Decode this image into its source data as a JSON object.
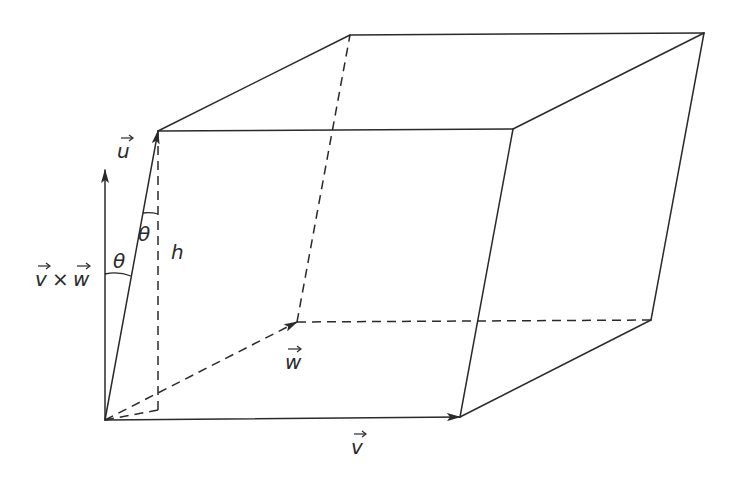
{
  "diagram": {
    "colors": {
      "stroke": "#2a2a2a",
      "background": "#ffffff"
    },
    "labels": {
      "u": "u",
      "v": "v",
      "w": "w",
      "cross": "v × w",
      "cross_v": "v",
      "cross_times": "×",
      "cross_w": "w",
      "theta_top": "θ",
      "theta_bottom": "θ",
      "h": "h"
    },
    "vertices": {
      "origin": [
        105,
        420
      ],
      "v_end": [
        460,
        417
      ],
      "w_end": [
        297,
        322
      ],
      "u_end": [
        158,
        131
      ],
      "front_top_right": [
        513,
        129
      ],
      "back_top_left": [
        350,
        35
      ],
      "back_top_right": [
        704,
        33
      ],
      "back_bottom_right": [
        651,
        320
      ]
    },
    "normal_vector": {
      "from": [
        105,
        420
      ],
      "to": [
        105,
        170
      ]
    },
    "height_line": {
      "from": [
        158,
        131
      ],
      "to": [
        158,
        410
      ]
    }
  }
}
